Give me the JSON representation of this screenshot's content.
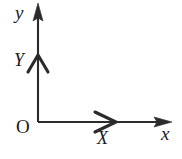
{
  "figure": {
    "type": "coordinate-axes-diagram",
    "background_color": "#ffffff",
    "stroke_color": "#2b2b2b",
    "label_color": "#1a1a1a"
  },
  "labels": {
    "y_axis": "y",
    "x_axis": "x",
    "origin": "O",
    "vector_Y": "Y",
    "vector_X": "X"
  },
  "geometry": {
    "origin": {
      "x": 38,
      "y": 122
    },
    "y_axis": {
      "from": {
        "x": 38,
        "y": 122
      },
      "to": {
        "x": 38,
        "y": 3
      },
      "arrowhead": "solid-triangle",
      "direction": "up"
    },
    "x_axis": {
      "from": {
        "x": 38,
        "y": 122
      },
      "to": {
        "x": 172,
        "y": 122
      },
      "arrowhead": "solid-triangle",
      "direction": "right"
    },
    "vector_Y_marker": {
      "position": {
        "x": 38,
        "y": 56
      },
      "arrowhead": "open-chevron",
      "direction": "up"
    },
    "vector_X_marker": {
      "position": {
        "x": 114,
        "y": 122
      },
      "arrowhead": "open-chevron",
      "direction": "right"
    }
  }
}
